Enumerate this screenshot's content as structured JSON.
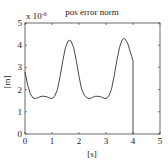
{
  "chart_data": {
    "type": "line",
    "title": "pos error norm",
    "xlabel": "[s]",
    "ylabel": "[m]",
    "y_multiplier": "x 10^-6",
    "multiplier_base": "x 10",
    "multiplier_exp": "-6",
    "xlim": [
      0,
      5
    ],
    "ylim": [
      0,
      5
    ],
    "xticks": [
      "0",
      "1",
      "2",
      "3",
      "4",
      "5"
    ],
    "yticks": [
      "0",
      "1",
      "2",
      "3",
      "4",
      "5"
    ],
    "grid": false,
    "series": [
      {
        "name": "pos error norm",
        "x": [
          0,
          0.1,
          0.2,
          0.3,
          0.4,
          0.5,
          0.6,
          0.7,
          0.8,
          0.9,
          1.0,
          1.1,
          1.2,
          1.3,
          1.4,
          1.5,
          1.6,
          1.65,
          1.7,
          1.8,
          1.9,
          2.0,
          2.1,
          2.2,
          2.3,
          2.4,
          2.5,
          2.6,
          2.7,
          2.8,
          2.9,
          3.0,
          3.1,
          3.2,
          3.3,
          3.4,
          3.5,
          3.6,
          3.65,
          3.7,
          3.8,
          3.9,
          3.95,
          4.0,
          4.0
        ],
        "values": [
          2.8,
          2.2,
          1.8,
          1.62,
          1.6,
          1.65,
          1.7,
          1.7,
          1.68,
          1.62,
          1.6,
          1.7,
          2.0,
          2.6,
          3.3,
          3.9,
          4.2,
          4.22,
          4.2,
          3.9,
          3.3,
          2.6,
          2.0,
          1.75,
          1.62,
          1.6,
          1.65,
          1.7,
          1.7,
          1.68,
          1.62,
          1.6,
          1.7,
          2.0,
          2.6,
          3.3,
          3.9,
          4.25,
          4.3,
          4.28,
          4.1,
          3.7,
          3.5,
          3.3,
          0
        ]
      }
    ]
  }
}
